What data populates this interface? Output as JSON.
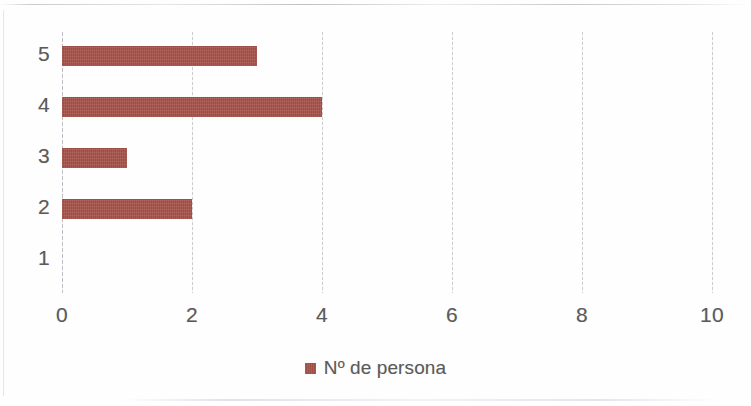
{
  "chart_data": {
    "type": "bar",
    "orientation": "horizontal",
    "title": "",
    "xlabel": "",
    "ylabel": "",
    "categories": [
      "5",
      "4",
      "3",
      "2",
      "1"
    ],
    "values": [
      3,
      4,
      1,
      2,
      0
    ],
    "series": [
      {
        "name": "Nº de persona",
        "values": [
          3,
          4,
          1,
          2,
          0
        ],
        "color": "#a8544a"
      }
    ],
    "xlim": [
      0,
      10
    ],
    "xticks": [
      0,
      2,
      4,
      6,
      8,
      10
    ],
    "xtick_labels": [
      "0",
      "2",
      "4",
      "6",
      "8",
      "10"
    ],
    "ytick_labels": [
      "5",
      "4",
      "3",
      "2",
      "1"
    ],
    "grid": true,
    "grid_axis": "x",
    "legend": {
      "position": "bottom",
      "entries": [
        {
          "label": "Nº de persona",
          "color": "#a8544a",
          "marker": "square-swatch"
        }
      ]
    },
    "colors": {
      "bar": "#a8544a",
      "gridline": "#c4c4ca",
      "axis_text": "#5b5b5b",
      "background": "#fefefe"
    }
  }
}
